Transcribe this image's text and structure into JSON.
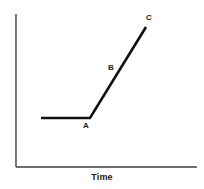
{
  "figure": {
    "width": 204,
    "height": 189,
    "background": "#ffffff"
  },
  "axes": {
    "line_color": "#3f3f3f",
    "line_width": 1.4,
    "y_axis": {
      "x": 16,
      "y_top": 14,
      "y_bottom": 167
    },
    "x_axis": {
      "y": 167,
      "x_left": 16,
      "x_right": 197
    },
    "x_title": "Time",
    "y_title": ""
  },
  "chart_data": {
    "type": "line",
    "title": "",
    "subtitle": "",
    "xlabel": "Time",
    "ylabel": "",
    "grid": false,
    "legend": null,
    "xlim": [
      0,
      1
    ],
    "ylim": [
      0,
      1
    ],
    "axis_ticks": {
      "x": [],
      "y": []
    },
    "series": [
      {
        "name": "curve",
        "color": "#111111",
        "line_width": 2.6,
        "points_px": [
          {
            "x": 41,
            "y": 118
          },
          {
            "x": 90,
            "y": 118
          },
          {
            "x": 146,
            "y": 27
          }
        ],
        "description": "flat segment then steep linear rise"
      }
    ],
    "annotations": [
      {
        "id": "A",
        "text": "A",
        "point_px": {
          "x": 90,
          "y": 118
        },
        "label_px": {
          "x": 86,
          "y": 127
        }
      },
      {
        "id": "B",
        "text": "B",
        "point_px": {
          "x": 118,
          "y": 73
        },
        "label_px": {
          "x": 111,
          "y": 69
        }
      },
      {
        "id": "C",
        "text": "C",
        "point_px": {
          "x": 146,
          "y": 27
        },
        "label_px": {
          "x": 149,
          "y": 19
        }
      }
    ]
  },
  "labels": {
    "a": "A",
    "b": "B",
    "c": "C"
  }
}
